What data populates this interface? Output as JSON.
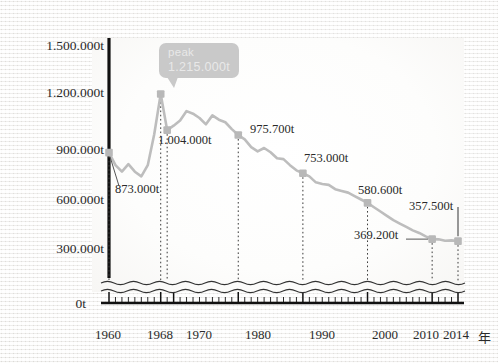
{
  "chart_data": {
    "type": "line",
    "title": "",
    "xlabel": "年",
    "ylabel": "",
    "grid": false,
    "legend": "none",
    "axis_break": true,
    "ylim": [
      0,
      1500000
    ],
    "xlim": [
      1960,
      2014
    ],
    "y_ticks": [
      "0t",
      "300.000t",
      "600.000t",
      "900.000t",
      "1.200.000t",
      "1.500.000t"
    ],
    "y_tick_values": [
      0,
      300000,
      600000,
      900000,
      1200000,
      1500000
    ],
    "x_ticks": [
      "1960",
      "1968",
      "1970",
      "1980",
      "1990",
      "2000",
      "2010",
      "2014"
    ],
    "x_tick_values": [
      1960,
      1968,
      1970,
      1980,
      1990,
      2000,
      2010,
      2014
    ],
    "x_axis_unit": "年",
    "annotation": {
      "label": "peak",
      "value": "1.215.000t",
      "year": 1968,
      "value_number": 1215000
    },
    "labeled_points": [
      {
        "year": 1960,
        "label": "873.000t",
        "value": 873000
      },
      {
        "year": 1968,
        "label": "1.215.000t",
        "value": 1215000
      },
      {
        "year": 1969,
        "label": "1.004.000t",
        "value": 1004000
      },
      {
        "year": 1980,
        "label": "975.700t",
        "value": 975700
      },
      {
        "year": 1990,
        "label": "753.000t",
        "value": 753000
      },
      {
        "year": 2000,
        "label": "580.600t",
        "value": 580600
      },
      {
        "year": 2010,
        "label": "369.200t",
        "value": 369200
      },
      {
        "year": 2014,
        "label": "357.500t",
        "value": 357500
      }
    ],
    "x": [
      1960,
      1961,
      1962,
      1963,
      1964,
      1965,
      1966,
      1967,
      1968,
      1969,
      1970,
      1971,
      1972,
      1973,
      1974,
      1975,
      1976,
      1977,
      1978,
      1979,
      1980,
      1981,
      1982,
      1983,
      1984,
      1985,
      1986,
      1987,
      1988,
      1989,
      1990,
      1991,
      1992,
      1993,
      1994,
      1995,
      1996,
      1997,
      1998,
      1999,
      2000,
      2001,
      2002,
      2003,
      2004,
      2005,
      2006,
      2007,
      2008,
      2009,
      2010,
      2011,
      2012,
      2013,
      2014
    ],
    "values": [
      873000,
      800000,
      762000,
      806000,
      762000,
      735000,
      800000,
      980000,
      1215000,
      1004000,
      1030000,
      1060000,
      1115000,
      1100000,
      1075000,
      1038000,
      1090000,
      1065000,
      1050000,
      1010000,
      975700,
      950000,
      905000,
      880000,
      900000,
      875000,
      840000,
      835000,
      800000,
      770000,
      753000,
      735000,
      700000,
      690000,
      685000,
      660000,
      650000,
      640000,
      620000,
      600000,
      580600,
      555000,
      530000,
      505000,
      480000,
      460000,
      440000,
      420000,
      405000,
      385000,
      369200,
      368000,
      360000,
      362000,
      357500
    ],
    "series_color": "#bdbdbd",
    "marker_color": "#b8b8b8"
  },
  "colors": {
    "series": "#bdbdbd",
    "marker": "#b8b8b8",
    "axis": "#111111",
    "text": "#2a2a2a",
    "tooltip_bg": "#c9c9c9",
    "tooltip_text": "#e8e8e8",
    "background": "#f4f3f1"
  },
  "y_axis": {
    "ticks": [
      {
        "label": "1.500.000t",
        "value": 1500000
      },
      {
        "label": "1.200.000t",
        "value": 1200000
      },
      {
        "label": "900.000t",
        "value": 900000
      },
      {
        "label": "600.000t",
        "value": 600000
      },
      {
        "label": "300.000t",
        "value": 300000
      },
      {
        "label": "0t",
        "value": 0
      }
    ]
  },
  "x_axis": {
    "ticks": [
      {
        "label": "1960",
        "value": 1960
      },
      {
        "label": "1968",
        "value": 1968
      },
      {
        "label": "1970",
        "value": 1970
      },
      {
        "label": "1980",
        "value": 1980
      },
      {
        "label": "1990",
        "value": 1990
      },
      {
        "label": "2000",
        "value": 2000
      },
      {
        "label": "2010",
        "value": 2010
      },
      {
        "label": "2014",
        "value": 2014
      }
    ],
    "unit": "年"
  },
  "tooltip": {
    "line1": "peak",
    "line2": "1.215.000t"
  },
  "point_labels": {
    "p1960": "873.000t",
    "p1969": "1.004.000t",
    "p1980": "975.700t",
    "p1990": "753.000t",
    "p2000": "580.600t",
    "p2010": "369.200t",
    "p2014": "357.500t"
  }
}
